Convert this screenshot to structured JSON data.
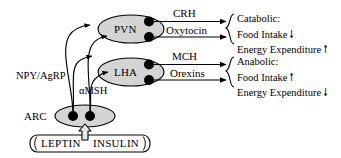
{
  "diagram": {
    "colors": {
      "stroke": "#000000",
      "node_fill": "#d4d4d4",
      "neuron_fill": "#000000",
      "box_fill": "#ffffff"
    },
    "nodes": [
      {
        "id": "pvn",
        "label": "PVN",
        "shape": "ellipse"
      },
      {
        "id": "lha",
        "label": "LHA",
        "shape": "ellipse"
      },
      {
        "id": "arc",
        "label": "ARC",
        "shape": "ellipse"
      }
    ],
    "afferent_labels": [
      {
        "id": "npy-agrp",
        "label": "NPY/AgRP"
      },
      {
        "id": "amsh",
        "label": "αMSH"
      }
    ],
    "efferent_labels": [
      {
        "id": "crh",
        "label": "CRH"
      },
      {
        "id": "oxytocin",
        "label": "Oxytocin"
      },
      {
        "id": "mch",
        "label": "MCH"
      },
      {
        "id": "orexins",
        "label": "Orexins"
      }
    ],
    "outcomes": [
      {
        "id": "catabolic",
        "heading": "Catabolic:",
        "lines": [
          {
            "text": "Food Intake",
            "arrow": "↓"
          },
          {
            "text": "Energy Expenditure",
            "arrow": "↑"
          }
        ]
      },
      {
        "id": "anabolic",
        "heading": "Anabolic:",
        "lines": [
          {
            "text": "Food Intake",
            "arrow": "↑"
          },
          {
            "text": "Energy Expenditure",
            "arrow": "↓"
          }
        ]
      }
    ],
    "hormones": {
      "left": "LEPTIN",
      "right": "INSULIN"
    }
  }
}
